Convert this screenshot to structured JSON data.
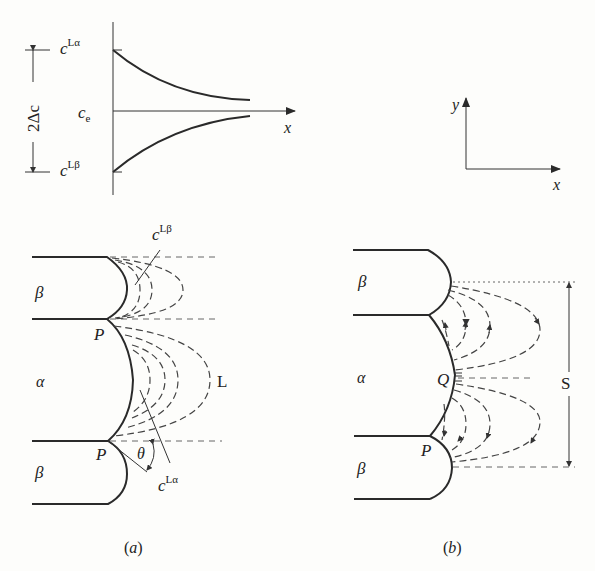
{
  "concentration_profile": {
    "top_label": "c",
    "top_sup": "Lα",
    "mid_label": "c",
    "mid_sub": "e",
    "bottom_label": "c",
    "bottom_sup": "Lβ",
    "span_label": "2Δc",
    "x_axis_label": "x"
  },
  "axes_legend": {
    "y_label": "y",
    "x_label": "x"
  },
  "panel_a": {
    "caption": "(a)",
    "phase_beta_top": "β",
    "phase_alpha": "α",
    "phase_beta_bottom": "β",
    "junction_top": "P",
    "junction_bottom": "P",
    "liquid_label": "L",
    "angle_label": "θ",
    "callout_top": "c",
    "callout_top_sup": "Lβ",
    "callout_bottom": "c",
    "callout_bottom_sup": "Lα"
  },
  "panel_b": {
    "caption": "(b)",
    "phase_beta_top": "β",
    "phase_alpha": "α",
    "phase_beta_bottom": "β",
    "center_point": "Q",
    "junction_point": "P",
    "spacing_label": "S"
  }
}
